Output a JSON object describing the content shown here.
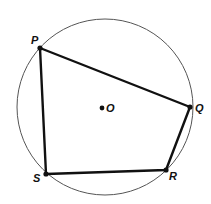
{
  "diagram": {
    "type": "inscribed-quadrilateral",
    "circle": {
      "cx": 105,
      "cy": 107,
      "r": 88,
      "stroke": "#555555"
    },
    "center": {
      "label": "O",
      "x": 102,
      "y": 108
    },
    "quadrilateral": {
      "stroke": "#111111"
    },
    "vertices": [
      {
        "label": "P",
        "x": 40,
        "y": 48,
        "lx": 27,
        "ly": 44
      },
      {
        "label": "Q",
        "x": 190,
        "y": 107,
        "lx": 194,
        "ly": 112
      },
      {
        "label": "R",
        "x": 166,
        "y": 170,
        "lx": 168,
        "ly": 182
      },
      {
        "label": "S",
        "x": 46,
        "y": 174,
        "lx": 33,
        "ly": 183
      }
    ]
  }
}
